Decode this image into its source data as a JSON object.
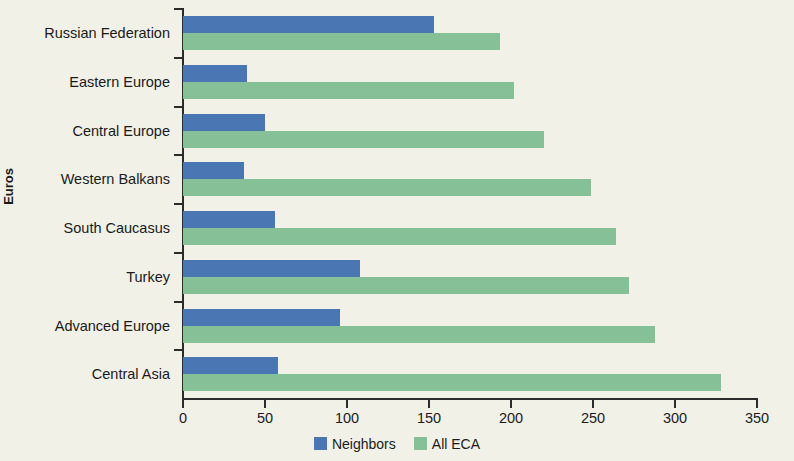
{
  "chart_data": {
    "type": "bar",
    "orientation": "horizontal",
    "title": "",
    "xlabel": "",
    "ylabel": "Euros",
    "xlim": [
      0,
      350
    ],
    "xticks": [
      0,
      50,
      100,
      150,
      200,
      250,
      300,
      350
    ],
    "grid": false,
    "legend_position": "bottom",
    "categories": [
      "Russian Federation",
      "Eastern Europe",
      "Central Europe",
      "Western Balkans",
      "South Caucasus",
      "Turkey",
      "Advanced Europe",
      "Central Asia"
    ],
    "series": [
      {
        "name": "Neighbors",
        "color": "#4a77b4",
        "values": [
          153,
          39,
          50,
          37,
          56,
          108,
          96,
          58
        ]
      },
      {
        "name": "All ECA",
        "color": "#85c096",
        "values": [
          193,
          202,
          220,
          249,
          264,
          272,
          288,
          328
        ]
      }
    ]
  },
  "axis": {
    "y_title": "Euros",
    "x_tick_labels": [
      "0",
      "50",
      "100",
      "150",
      "200",
      "250",
      "300",
      "350"
    ]
  },
  "legend": {
    "items": [
      {
        "label": "Neighbors",
        "color": "#4a77b4"
      },
      {
        "label": "All ECA",
        "color": "#85c096"
      }
    ]
  },
  "colors": {
    "background": "#f2f1e8",
    "axis": "#2b2b2b",
    "neighbors": "#4a77b4",
    "all_eca": "#85c096"
  }
}
